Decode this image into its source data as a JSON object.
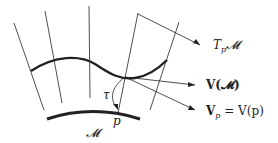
{
  "diagram": {
    "labels": {
      "tangent_space": "T",
      "tangent_space_sub": "p",
      "tangent_space_manifold": "𝓜",
      "vector_field_of_manifold": "V(𝓜)",
      "vector_field_V": "V",
      "vector_at_p_sub": "p",
      "vector_at_p_rest": " = V(p)",
      "tau": "τ",
      "point": "p",
      "manifold": "𝓜"
    },
    "colors": {
      "stroke": "#222222",
      "background": "#ffffff"
    }
  }
}
